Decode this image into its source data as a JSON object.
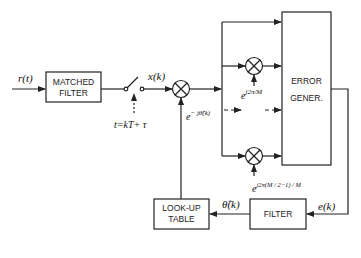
{
  "diagram": {
    "type": "block-diagram",
    "blocks": {
      "matched_filter": {
        "line1": "MATCHED",
        "line2": "FILTER"
      },
      "error_generator": {
        "line1": "ERROR",
        "line2": "GENER."
      },
      "filter": {
        "label": "FILTER"
      },
      "lookup_table": {
        "line1": "LOOK-UP",
        "line2": "TABLE"
      }
    },
    "signals": {
      "input": "r(t)",
      "sampled": "x(k)",
      "sampling_instant": "t=kT+ τ",
      "derotation": "e",
      "derotation_exp": "− jθ̂(k)",
      "phase_estimate": "θ̂(k)",
      "error": "e(k)",
      "branch1_e": "e",
      "branch1_exp": "j2π/M",
      "branchN_e": "e",
      "branchN_exp": "j2π(M / 2−1) / M"
    },
    "colors": {
      "line": "#222222",
      "background": "#ffffff"
    }
  }
}
